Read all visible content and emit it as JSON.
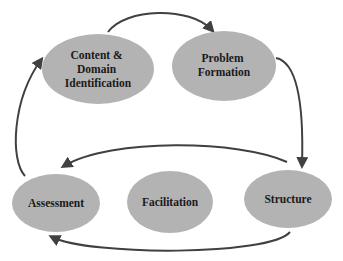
{
  "diagram": {
    "type": "cycle-flow",
    "colors": {
      "background": "#ffffff",
      "node_fill": "#b3b3b3",
      "arrow": "#404040",
      "text": "#1a1a1a"
    },
    "nodes": [
      {
        "id": "content",
        "lines": [
          "Content &",
          "Domain",
          "Identification"
        ],
        "cx": 98,
        "cy": 69,
        "rx": 56,
        "ry": 35
      },
      {
        "id": "problem",
        "lines": [
          "Problem",
          "Formation"
        ],
        "cx": 224,
        "cy": 66,
        "rx": 52,
        "ry": 35
      },
      {
        "id": "assessment",
        "lines": [
          "Assessment"
        ],
        "cx": 56,
        "cy": 203,
        "rx": 44,
        "ry": 29
      },
      {
        "id": "facilitation",
        "lines": [
          "Facilitation"
        ],
        "cx": 170,
        "cy": 202,
        "rx": 43,
        "ry": 31
      },
      {
        "id": "structure",
        "lines": [
          "Structure"
        ],
        "cx": 288,
        "cy": 199,
        "rx": 44,
        "ry": 29
      }
    ],
    "edges": [
      {
        "from": "content",
        "to": "problem"
      },
      {
        "from": "problem",
        "to": "structure"
      },
      {
        "from": "structure",
        "to": "assessment",
        "route": "upper"
      },
      {
        "from": "structure",
        "to": "assessment",
        "route": "lower"
      },
      {
        "from": "assessment",
        "to": "content"
      }
    ]
  }
}
